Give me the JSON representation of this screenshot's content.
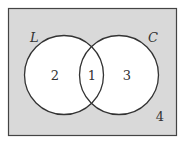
{
  "diagram": {
    "type": "venn",
    "universe": {
      "region_label": "4",
      "fill": "#d9d9d9",
      "stroke": "#444444"
    },
    "sets": [
      {
        "name": "L",
        "only_region_label": "2"
      },
      {
        "name": "C",
        "only_region_label": "3"
      }
    ],
    "intersection_label": "1",
    "circle_fill": "#ffffff",
    "circle_stroke": "#333333"
  }
}
